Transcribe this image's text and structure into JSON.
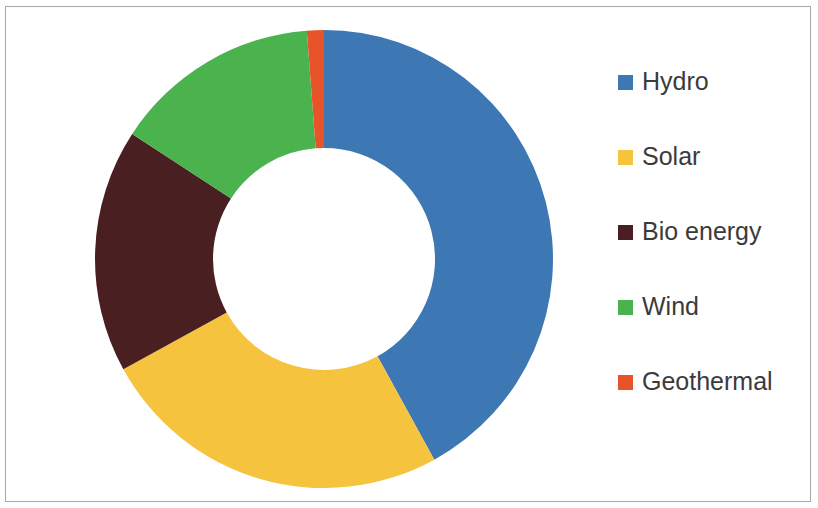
{
  "chart_data": {
    "type": "pie",
    "variant": "donut",
    "title": "",
    "subtitle": "",
    "xlabel": "",
    "ylabel": "",
    "legend_position": "right",
    "grid": false,
    "start_angle_deg": 0,
    "direction": "clockwise",
    "hole_ratio": 0.485,
    "categories": [
      "Hydro",
      "Solar",
      "Bio energy",
      "Wind",
      "Geothermal"
    ],
    "values": [
      42.0,
      25.0,
      17.2,
      14.6,
      5.5
    ],
    "unit": "%",
    "colors": [
      "#3d78b4",
      "#f6c33f",
      "#4a1f21",
      "#4ab34e",
      "#e8542a"
    ],
    "slices": [
      {
        "label": "Hydro",
        "value": 42.0,
        "color": "#3d78b4",
        "start_deg": 0.0,
        "end_deg": 151.2
      },
      {
        "label": "Solar",
        "value": 25.0,
        "color": "#f6c33f",
        "start_deg": 151.2,
        "end_deg": 241.2
      },
      {
        "label": "Bio energy",
        "value": 17.2,
        "color": "#4a1f21",
        "start_deg": 241.2,
        "end_deg": 303.1
      },
      {
        "label": "Wind",
        "value": 14.6,
        "color": "#4ab34e",
        "start_deg": 303.1,
        "end_deg": 355.7
      },
      {
        "label": "Geothermal",
        "value": 5.5,
        "color": "#e8542a",
        "start_deg": 355.7,
        "end_deg": 360.0
      }
    ]
  },
  "legend": {
    "items": [
      {
        "label": "Hydro",
        "color": "#3d78b4"
      },
      {
        "label": "Solar",
        "color": "#f6c33f"
      },
      {
        "label": "Bio energy",
        "color": "#4a1f21"
      },
      {
        "label": "Wind",
        "color": "#4ab34e"
      },
      {
        "label": "Geothermal",
        "color": "#e8542a"
      }
    ]
  },
  "geometry": {
    "center_x": 324,
    "center_y": 259,
    "outer_radius": 229,
    "inner_radius": 111
  },
  "style": {
    "frame_color": "#a9a9a9",
    "background": "#ffffff",
    "label_color": "#3b3b3b"
  }
}
